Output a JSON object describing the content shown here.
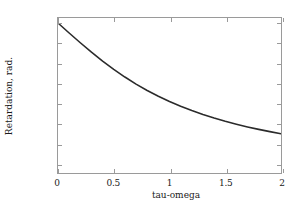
{
  "chart_data": {
    "type": "line",
    "title": "",
    "xlabel": "tau-omega",
    "ylabel": "Retardation, rad.",
    "xlim": [
      0,
      2
    ],
    "ylim": [
      -1.5,
      0.05
    ],
    "grid": false,
    "legend": null,
    "xticks": [
      "0",
      "0.5",
      "1",
      "1.5",
      "2"
    ],
    "xtick_values": [
      0,
      0.5,
      1,
      1.5,
      2
    ],
    "yticks": [
      "0",
      "−0.2",
      "−0.4",
      "−0.6",
      "−0.8",
      "−1",
      "−1.2",
      "−1.4"
    ],
    "ytick_values": [
      0,
      -0.2,
      -0.4,
      -0.6,
      -0.8,
      -1.0,
      -1.2,
      -1.4
    ],
    "line_color": "#2b2b2b",
    "axis_color": "#9a9a9a",
    "series": [
      {
        "name": "retardation",
        "x": [
          0,
          0.1,
          0.2,
          0.3,
          0.4,
          0.5,
          0.6,
          0.7,
          0.8,
          0.9,
          1.0,
          1.1,
          1.2,
          1.3,
          1.4,
          1.5,
          1.6,
          1.7,
          1.8,
          1.9,
          2.0
        ],
        "values": [
          0,
          -0.0997,
          -0.1974,
          -0.2915,
          -0.3805,
          -0.4636,
          -0.5404,
          -0.6107,
          -0.6747,
          -0.7328,
          -0.7854,
          -0.833,
          -0.8761,
          -0.9151,
          -0.9505,
          -0.9828,
          -1.0122,
          -1.039,
          -1.0637,
          -1.0864,
          -1.1071
        ]
      }
    ]
  }
}
